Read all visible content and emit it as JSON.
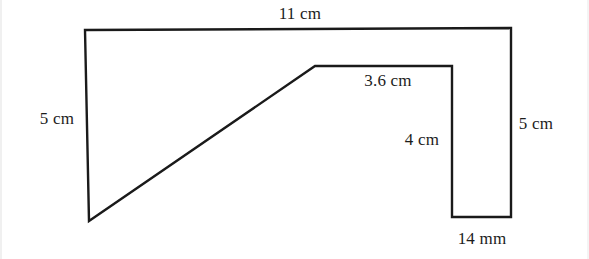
{
  "figure": {
    "name": "composite-polygon-dimension-diagram",
    "background_color": "#ffffff",
    "stroke_color": "#1a1a1a",
    "stroke_width": 2.4,
    "canvas": {
      "width": 589,
      "height": 259
    }
  },
  "labels": {
    "top": {
      "text": "11 cm",
      "x": 300,
      "y": 13
    },
    "left": {
      "text": "5 cm",
      "x": 57,
      "y": 118
    },
    "middle_top": {
      "text": "3.6 cm",
      "x": 388,
      "y": 80
    },
    "middle_vertical": {
      "text": "4 cm",
      "x": 422,
      "y": 139
    },
    "right": {
      "text": "5 cm",
      "x": 536,
      "y": 123
    },
    "bottom": {
      "text": "14 mm",
      "x": 482,
      "y": 238
    }
  },
  "outline": {
    "points_description": "closed polygon traced clockwise from top-left corner",
    "path": "M 85,30 L 511,28 L 511,217 L 452,217 L 452,66 L 315,66 L 89,221 Z",
    "vertices": [
      {
        "name": "top-left",
        "x": 85,
        "y": 30
      },
      {
        "name": "top-right",
        "x": 511,
        "y": 28
      },
      {
        "name": "bottom-right",
        "x": 511,
        "y": 217
      },
      {
        "name": "notch-bottom-left",
        "x": 452,
        "y": 217
      },
      {
        "name": "notch-top-left",
        "x": 452,
        "y": 66
      },
      {
        "name": "ledge-left",
        "x": 315,
        "y": 66
      },
      {
        "name": "diagonal-bottom",
        "x": 89,
        "y": 221
      }
    ]
  },
  "edges": [
    {
      "name": "top-edge",
      "label": "11 cm",
      "from": "top-left",
      "to": "top-right"
    },
    {
      "name": "right-edge",
      "label": "5 cm",
      "from": "top-right",
      "to": "bottom-right"
    },
    {
      "name": "notch-bottom-edge",
      "label": "14 mm",
      "from": "bottom-right",
      "to": "notch-bottom-left"
    },
    {
      "name": "notch-left-edge",
      "label": "4 cm",
      "from": "notch-bottom-left",
      "to": "notch-top-left"
    },
    {
      "name": "ledge-edge",
      "label": "3.6 cm",
      "from": "notch-top-left",
      "to": "ledge-left"
    },
    {
      "name": "diagonal-edge",
      "label": "",
      "from": "ledge-left",
      "to": "diagonal-bottom"
    },
    {
      "name": "left-edge",
      "label": "5 cm",
      "from": "diagonal-bottom",
      "to": "top-left"
    }
  ]
}
